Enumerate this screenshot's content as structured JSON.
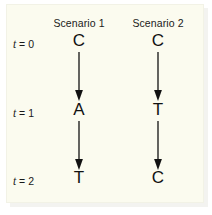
{
  "figure": {
    "background_color": "#fbfbef",
    "ink_color": "#111111",
    "columns": [
      {
        "header": "Scenario 1"
      },
      {
        "header": "Scenario 2"
      }
    ],
    "time_labels": [
      {
        "var": "t",
        "rest": " = 0"
      },
      {
        "var": "t",
        "rest": " = 1"
      },
      {
        "var": "t",
        "rest": " = 2"
      }
    ],
    "cells": {
      "scenario1": [
        "C",
        "A",
        "T"
      ],
      "scenario2": [
        "C",
        "T",
        "C"
      ]
    },
    "arrows": [
      {
        "label": "arrow-scenario1-t0-to-t1"
      },
      {
        "label": "arrow-scenario1-t1-to-t2"
      },
      {
        "label": "arrow-scenario2-t0-to-t1"
      },
      {
        "label": "arrow-scenario2-t1-to-t2"
      }
    ]
  }
}
